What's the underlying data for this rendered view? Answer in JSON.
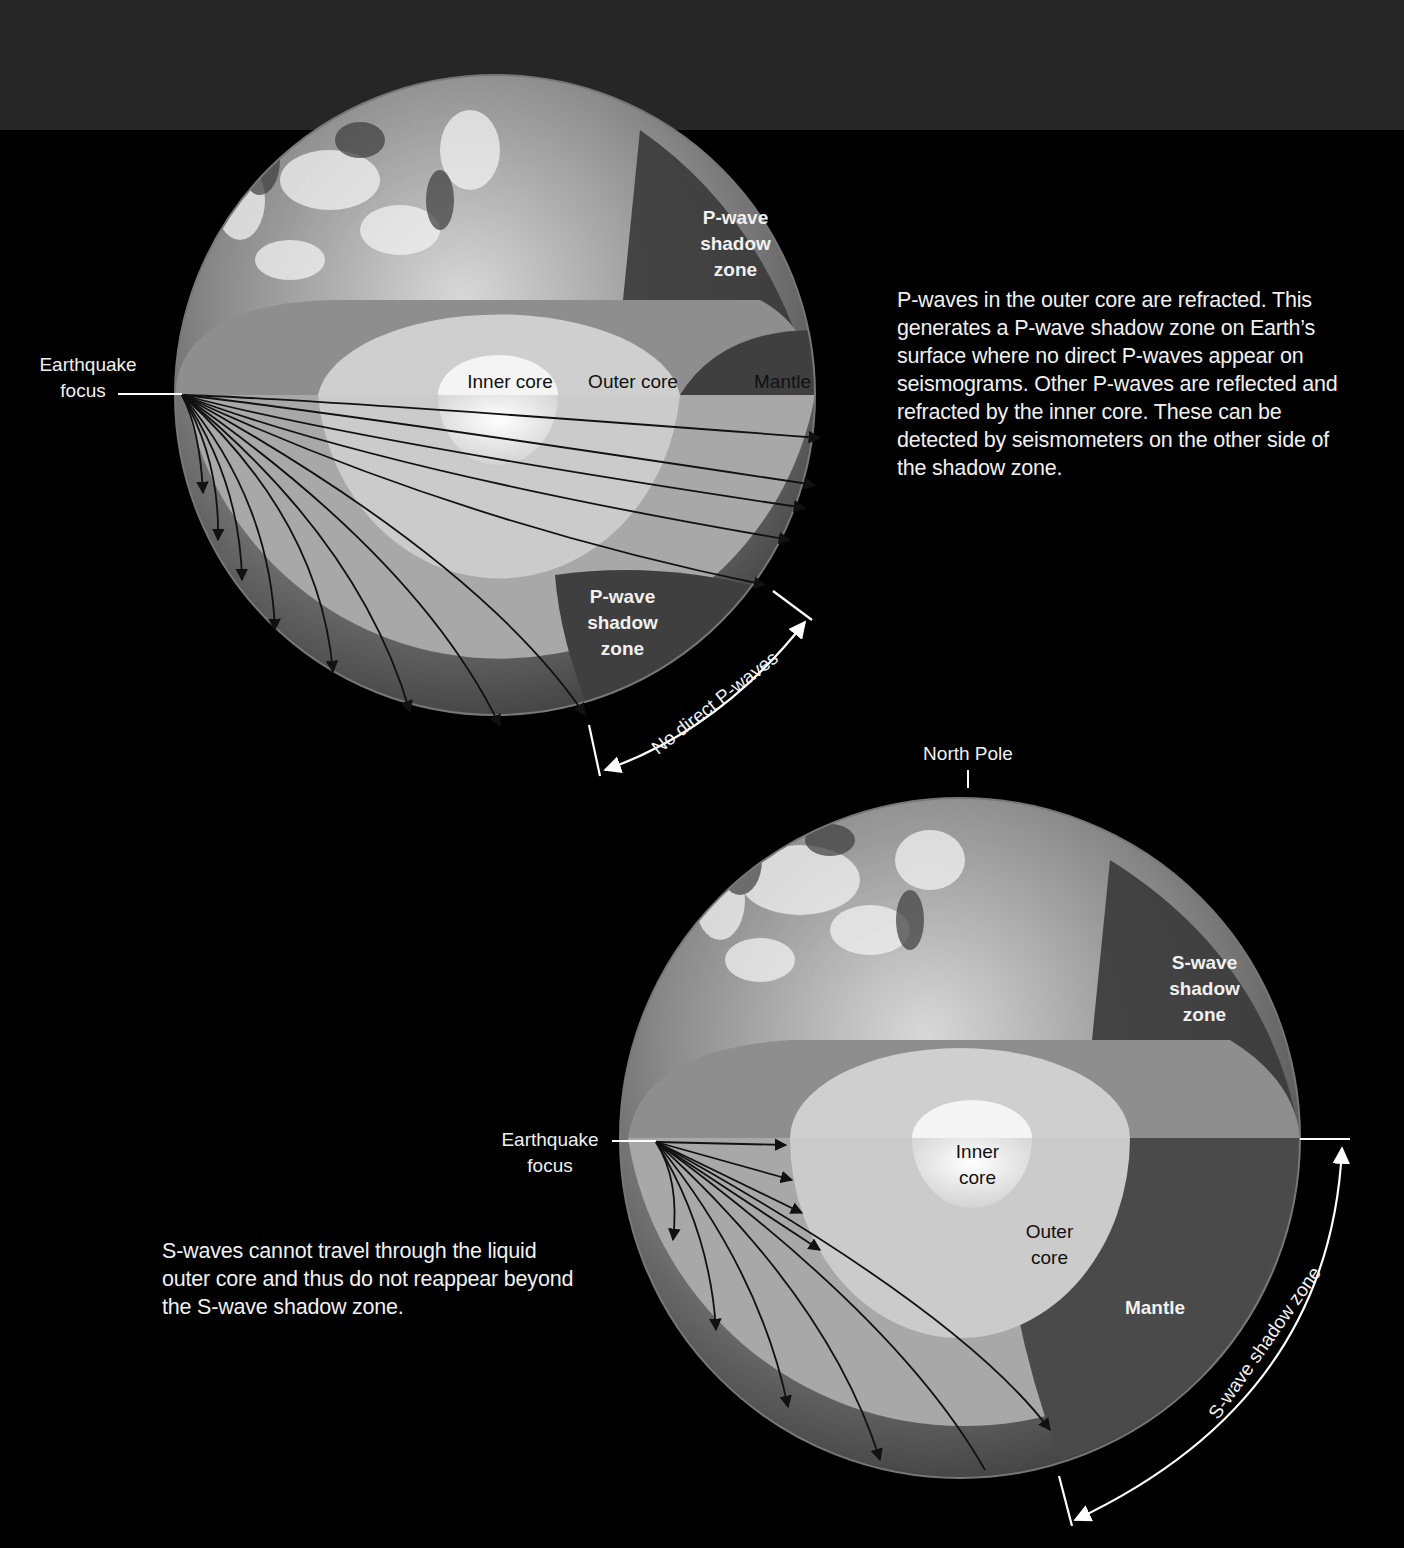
{
  "diagram": {
    "p_wave_figure": {
      "description": "P-waves in the outer core are refracted. This generates a P-wave shadow zone on Earth’s surface where no direct P-waves appear on seismograms. Other P-waves are reflected and refracted by the inner core. These can be detected by seismometers on the other side of the shadow zone.",
      "description_lines": [
        "P-waves in the outer core are refracted. This",
        "generates a P-wave shadow zone on Earth’s",
        "surface where no direct P-waves appear on",
        "seismograms. Other P-waves are reflected and",
        "refracted by the inner core. These can be",
        "detected by seismometers on the other side of",
        "the shadow zone."
      ],
      "focus_label_line1": "Earthquake",
      "focus_label_line2": "focus",
      "inner_core_label": "Inner core",
      "outer_core_label": "Outer core",
      "mantle_label": "Mantle",
      "shadow_zone_surface_label": [
        "P-wave",
        "shadow",
        "zone"
      ],
      "shadow_zone_interior_label": [
        "P-wave",
        "shadow",
        "zone"
      ],
      "arc_label": "No direct P-waves"
    },
    "s_wave_figure": {
      "description_lines": [
        "S-waves cannot travel through the liquid",
        "outer core and thus do not reappear beyond",
        "the S-wave shadow zone."
      ],
      "north_pole_label": "North Pole",
      "focus_label_line1": "Earthquake",
      "focus_label_line2": "focus",
      "inner_core_label": [
        "Inner",
        "core"
      ],
      "outer_core_label": [
        "Outer",
        "core"
      ],
      "mantle_label": "Mantle",
      "shadow_zone_surface_label": [
        "S-wave",
        "shadow",
        "zone"
      ],
      "arc_label": "S-wave shadow zone"
    },
    "colors": {
      "background": "#000000",
      "top_band": "#262626",
      "mantle": "#9a9a9a",
      "outer_core": "#c8c8c8",
      "inner_core": "#efefef",
      "shadow_zone": "#4a4a4a",
      "text": "#f0f0f0"
    }
  }
}
